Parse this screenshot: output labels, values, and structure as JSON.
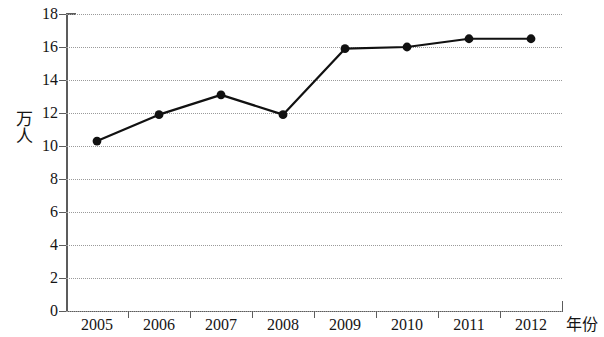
{
  "chart_data": {
    "type": "line",
    "title": "",
    "xlabel": "年份",
    "ylabel": "万人",
    "categories": [
      "2005",
      "2006",
      "2007",
      "2008",
      "2009",
      "2010",
      "2011",
      "2012"
    ],
    "values": [
      10.3,
      11.9,
      13.1,
      11.9,
      15.9,
      16.0,
      16.5,
      16.5
    ],
    "series": [
      {
        "name": "",
        "values": [
          10.3,
          11.9,
          13.1,
          11.9,
          15.9,
          16.0,
          16.5,
          16.5
        ]
      }
    ],
    "ylim": [
      0,
      18
    ],
    "y_ticks": [
      0,
      2,
      4,
      6,
      8,
      10,
      12,
      14,
      16,
      18
    ],
    "y_tick_labels": [
      "0",
      "2",
      "4",
      "6",
      "8",
      "10",
      "12",
      "14",
      "16",
      "18"
    ],
    "x_tick_labels": [
      "2005",
      "2006",
      "2007",
      "2008",
      "2009",
      "2010",
      "2011",
      "2012"
    ],
    "grid": "horizontal-dotted",
    "legend": "none",
    "marker": "filled-circle",
    "line_color": "#111111",
    "marker_color": "#111111",
    "grid_color": "#9a9a9a",
    "axis_color": "#5c5c5c",
    "background": "#ffffff"
  }
}
